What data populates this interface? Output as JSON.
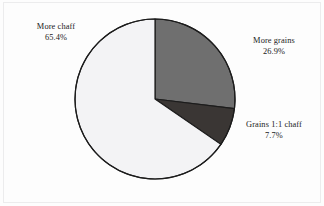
{
  "figure": {
    "background_color": "#fdfdfd",
    "frame_color": "#ececed"
  },
  "chart_data": {
    "type": "pie",
    "title": "",
    "subtitle": "",
    "xlabel": "",
    "ylabel": "",
    "legend_position": "none",
    "grid": false,
    "start_angle_deg": 0,
    "direction": "clockwise",
    "center": {
      "x": 155,
      "y": 99
    },
    "radius": 80,
    "outline_color": "#1c1c1c",
    "outline_width": 1.2,
    "categories": [
      "More grains",
      "Grains 1:1 chaff",
      "More chaff"
    ],
    "values": [
      26.9,
      7.7,
      65.4
    ],
    "value_unit": "%",
    "labels": [
      {
        "key": "more-grains",
        "name": "More grains",
        "percent_text": "26.9%",
        "value": 26.9,
        "color": "#6f6f6f",
        "start_angle_deg": 0.0,
        "end_angle_deg": 96.84
      },
      {
        "key": "grains-1-1-chaff",
        "name": "Grains 1:1 chaff",
        "percent_text": "7.7%",
        "value": 7.7,
        "color": "#3a3634",
        "start_angle_deg": 96.84,
        "end_angle_deg": 124.56
      },
      {
        "key": "more-chaff",
        "name": "More chaff",
        "percent_text": "65.4%",
        "value": 65.4,
        "color": "#f3f3f5",
        "start_angle_deg": 124.56,
        "end_angle_deg": 360.0
      }
    ]
  }
}
